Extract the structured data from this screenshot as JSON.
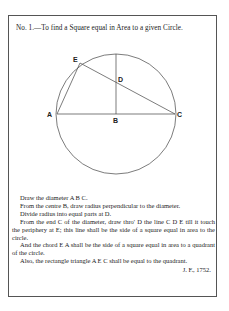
{
  "title": "No. 1.—To find a Square equal in Area to a given Circle.",
  "figure": {
    "labels": {
      "A": "A",
      "B": "B",
      "C": "C",
      "D": "D",
      "E": "E"
    },
    "line_color": "#444444"
  },
  "paragraphs": [
    "Draw the diameter A B C.",
    "From the centre B, draw radius perpendicular to the diameter.",
    "Divide radius into equal parts at D.",
    "From the end C of the diameter, draw thro' D the line C D E till it touch the periphery at E; this line shall be the side of a square equal in area to the circle.",
    "And the chord E A shall be the side of a square equal in area to a quadrant of the circle.",
    "Also, the rectangle triangle A E C shall be equal to the quadrant."
  ],
  "signature": "J. F., 1752."
}
